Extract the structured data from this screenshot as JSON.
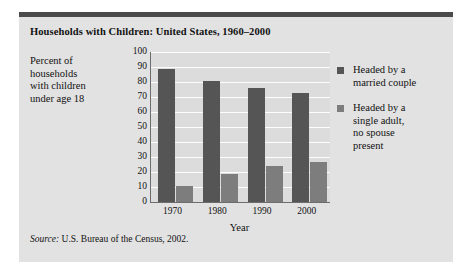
{
  "figure": {
    "title": "Households with Children: United States, 1960–2000",
    "source_label": "Source:",
    "source_text": "U.S. Bureau of the Census, 2002."
  },
  "legend": {
    "entries": [
      {
        "key": "married",
        "color": "#555555",
        "lines": [
          "Headed by a",
          "married couple"
        ]
      },
      {
        "key": "single",
        "color": "#7d7d7d",
        "lines": [
          "Headed by a",
          "single adult,",
          "no spouse",
          "present"
        ]
      }
    ]
  },
  "y_caption_lines": [
    "Percent of",
    "households",
    "with children",
    "under age 18"
  ],
  "chart_data": {
    "type": "bar",
    "title": "Households with Children: United States, 1960–2000",
    "xlabel": "Year",
    "ylabel": "Percent of households with children under age 18",
    "categories": [
      "1970",
      "1980",
      "1990",
      "2000"
    ],
    "series": [
      {
        "name": "Headed by a married couple",
        "color": "#555555",
        "values": [
          89,
          81,
          76,
          73
        ]
      },
      {
        "name": "Headed by a single adult, no spouse present",
        "color": "#7d7d7d",
        "values": [
          11,
          19,
          24,
          27
        ]
      }
    ],
    "ylim": [
      0,
      100
    ],
    "yticks": [
      0,
      10,
      20,
      30,
      40,
      50,
      60,
      70,
      80,
      90,
      100
    ],
    "ytick_labels": [
      "0",
      "10",
      "20",
      "30",
      "40",
      "50",
      "60",
      "70",
      "80",
      "90",
      "100"
    ],
    "grid": true,
    "legend_position": "right",
    "source": "Source: U.S. Bureau of the Census, 2002."
  }
}
